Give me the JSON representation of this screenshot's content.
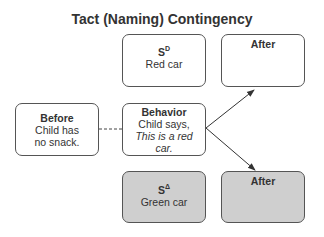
{
  "title": "Tact (Naming) Contingency",
  "boxes": {
    "sd": {
      "symbol": "S",
      "superscript": "D",
      "text": "Red car",
      "fill": "#ffffff"
    },
    "after_top": {
      "heading": "After",
      "text": "",
      "fill": "#ffffff"
    },
    "before": {
      "heading": "Before",
      "line1": "Child has",
      "line2": "no snack.",
      "fill": "#ffffff"
    },
    "behavior": {
      "heading": "Behavior",
      "line1": "Child says,",
      "line2": "This is a red",
      "line3": "car.",
      "fill": "#ffffff"
    },
    "sdelta": {
      "symbol": "S",
      "superscript": "Δ",
      "text": "Green car",
      "fill": "#cfcfcf"
    },
    "after_bottom": {
      "heading": "After",
      "text": "",
      "fill": "#cfcfcf"
    }
  },
  "connectors": [
    {
      "from": "before",
      "to": "behavior",
      "style": "dashed"
    },
    {
      "from": "behavior",
      "to": "after_top",
      "style": "arrow"
    },
    {
      "from": "behavior",
      "to": "after_bottom",
      "style": "arrow"
    }
  ]
}
